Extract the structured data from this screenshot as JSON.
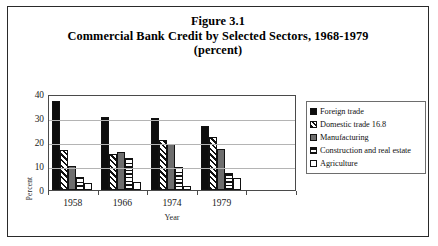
{
  "figure": {
    "title_line1": "Figure 3.1",
    "title_line2": "Commercial Bank Credit by Selected Sectors, 1968-1979",
    "title_line3": "(percent)"
  },
  "chart_data": {
    "type": "bar",
    "title": "Commercial Bank Credit by Selected Sectors, 1968-1979 (percent)",
    "xlabel": "Year",
    "ylabel": "Percent",
    "ylim": [
      0,
      40
    ],
    "yticks": [
      0,
      10,
      20,
      30,
      40
    ],
    "grid": true,
    "legend_position": "right",
    "categories": [
      "1958",
      "1966",
      "1974",
      "1979"
    ],
    "series": [
      {
        "name": "Foreign trade",
        "pattern": "solid-black",
        "values": [
          37,
          30.5,
          30,
          26.5
        ]
      },
      {
        "name": "Domestic trade 16.8",
        "pattern": "diagonal-stripe",
        "values": [
          16.8,
          15,
          21,
          22
        ]
      },
      {
        "name": "Manufacturing",
        "pattern": "solid-gray",
        "values": [
          10,
          16,
          19,
          17
        ]
      },
      {
        "name": "Construction and real estate",
        "pattern": "horizontal-stripe",
        "values": [
          5.5,
          13.5,
          9.5,
          7
        ]
      },
      {
        "name": "Agriculture",
        "pattern": "white",
        "values": [
          3,
          3.5,
          1.5,
          5
        ]
      }
    ]
  },
  "axes": {
    "y_title": "Percent",
    "x_title": "Year",
    "y_tick_labels": [
      "40",
      "30",
      "20",
      "10",
      "0"
    ],
    "x_tick_labels": [
      "1958",
      "1966",
      "1974",
      "1979"
    ]
  },
  "legend": {
    "items": [
      {
        "label": "Foreign trade"
      },
      {
        "label": "Domestic trade 16.8"
      },
      {
        "label": "Manufacturing"
      },
      {
        "label": "Construction and real estate"
      },
      {
        "label": "Agriculture"
      }
    ]
  }
}
